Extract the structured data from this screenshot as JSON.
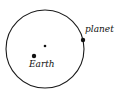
{
  "diagram": {
    "type": "orbit-sketch",
    "orbit": {
      "cx": 45,
      "cy": 49,
      "r": 39,
      "stroke": "#1a1a1a"
    },
    "center_point": {
      "x": 45,
      "y": 46,
      "r": 1.3
    },
    "bodies": [
      {
        "id": "earth",
        "label": "Earth",
        "x": 34,
        "y": 56,
        "r": 2.2,
        "label_x": 29,
        "label_y": 67
      },
      {
        "id": "planet",
        "label": "planet",
        "x": 83,
        "y": 40,
        "r": 2.2,
        "label_x": 85,
        "label_y": 32
      }
    ],
    "ink_color": "#111111",
    "background": "#ffffff"
  }
}
